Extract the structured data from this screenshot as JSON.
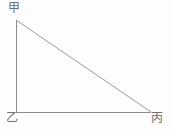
{
  "figure": {
    "type": "right-triangle-diagram",
    "background_color": "#fdfdfd",
    "stroke_color": "#8c8c8c",
    "label_color": "#6f6f6f",
    "stroke_width": 1,
    "width": 171,
    "height": 130
  },
  "vertices": {
    "top_left": {
      "label": "甲",
      "name": "jia",
      "x": 16,
      "y": 20
    },
    "bottom_left": {
      "label": "乙",
      "name": "yi",
      "x": 16,
      "y": 112
    },
    "bottom_right": {
      "label": "丙",
      "name": "bing",
      "x": 151,
      "y": 112
    }
  },
  "edges": [
    {
      "name": "vertical-leg",
      "from": "甲",
      "to": "乙",
      "points": "16,20 16,112"
    },
    {
      "name": "horizontal-leg",
      "from": "乙",
      "to": "丙",
      "points": "16,112 151,112"
    },
    {
      "name": "hypotenuse",
      "from": "甲",
      "to": "丙",
      "points": "16,20 151,112"
    }
  ],
  "geometry": {
    "right_angle_at": "乙",
    "polygon_points": "16,20 16,112 151,112"
  }
}
